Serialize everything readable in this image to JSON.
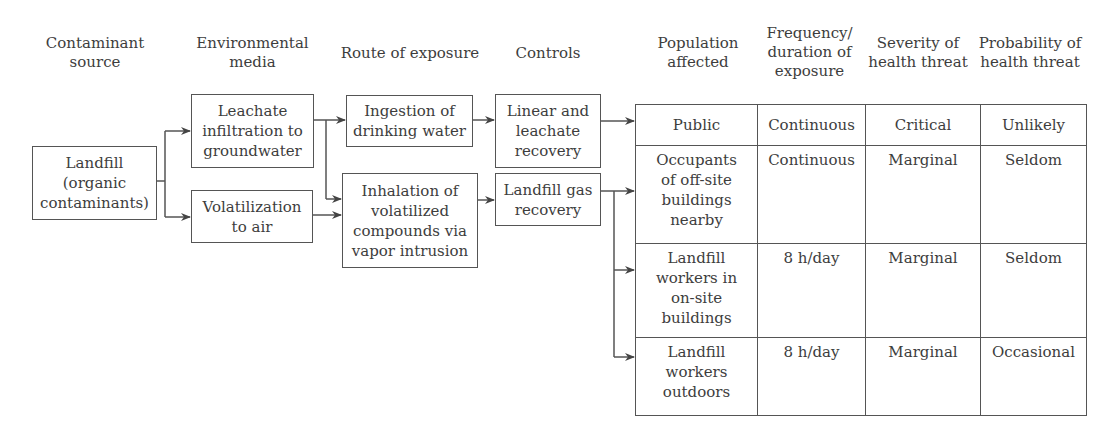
{
  "headers": {
    "source": "Contaminant\nsource",
    "media": "Environmental\nmedia",
    "route": "Route of exposure",
    "controls": "Controls",
    "population": "Population\naffected",
    "frequency": "Frequency/\nduration of\nexposure",
    "severity": "Severity of\nhealth threat",
    "probability": "Probability of\nhealth threat"
  },
  "source": {
    "label": "Landfill\n(organic\ncontaminants)"
  },
  "media": [
    {
      "label": "Leachate\ninfiltration to\ngroundwater"
    },
    {
      "label": "Volatilization\nto air"
    }
  ],
  "routes": [
    {
      "label": "Ingestion of\ndrinking water"
    },
    {
      "label": "Inhalation of\nvolatilized\ncompounds via\nvapor intrusion"
    }
  ],
  "controls": [
    {
      "label": "Linear and\nleachate\nrecovery"
    },
    {
      "label": "Landfill gas\nrecovery"
    }
  ],
  "table": {
    "rows": [
      {
        "population": "Public",
        "frequency": "Continuous",
        "severity": "Critical",
        "probability": "Unlikely"
      },
      {
        "population": "Occupants\nof off-site\nbuildings\nnearby",
        "frequency": "Continuous",
        "severity": "Marginal",
        "probability": "Seldom"
      },
      {
        "population": "Landfill\nworkers in\non-site\nbuildings",
        "frequency": "8 h/day",
        "severity": "Marginal",
        "probability": "Seldom"
      },
      {
        "population": "Landfill\nworkers\noutdoors",
        "frequency": "8 h/day",
        "severity": "Marginal",
        "probability": "Occasional"
      }
    ]
  },
  "colors": {
    "line": "#555555",
    "text": "#3d3d3d"
  }
}
